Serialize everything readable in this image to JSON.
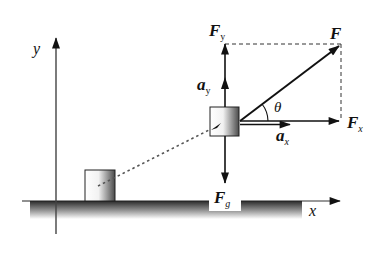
{
  "diagram": {
    "axes": {
      "y_label": "y",
      "x_label": "x"
    },
    "forces": {
      "F": {
        "symbol": "F",
        "subscript": ""
      },
      "Fx": {
        "symbol": "F",
        "subscript": "x"
      },
      "Fy": {
        "symbol": "F",
        "subscript": "y"
      },
      "Fg": {
        "symbol": "F",
        "subscript": "g"
      }
    },
    "accelerations": {
      "ax": {
        "symbol": "a",
        "subscript": "x"
      },
      "ay": {
        "symbol": "a",
        "subscript": "y"
      }
    },
    "angle": {
      "symbol": "θ"
    },
    "colors": {
      "ink": "#111111",
      "axis": "#333333",
      "ground_top": "#2a2a2a",
      "ground_fade": "#ffffff",
      "block_shade": "#555555"
    }
  }
}
